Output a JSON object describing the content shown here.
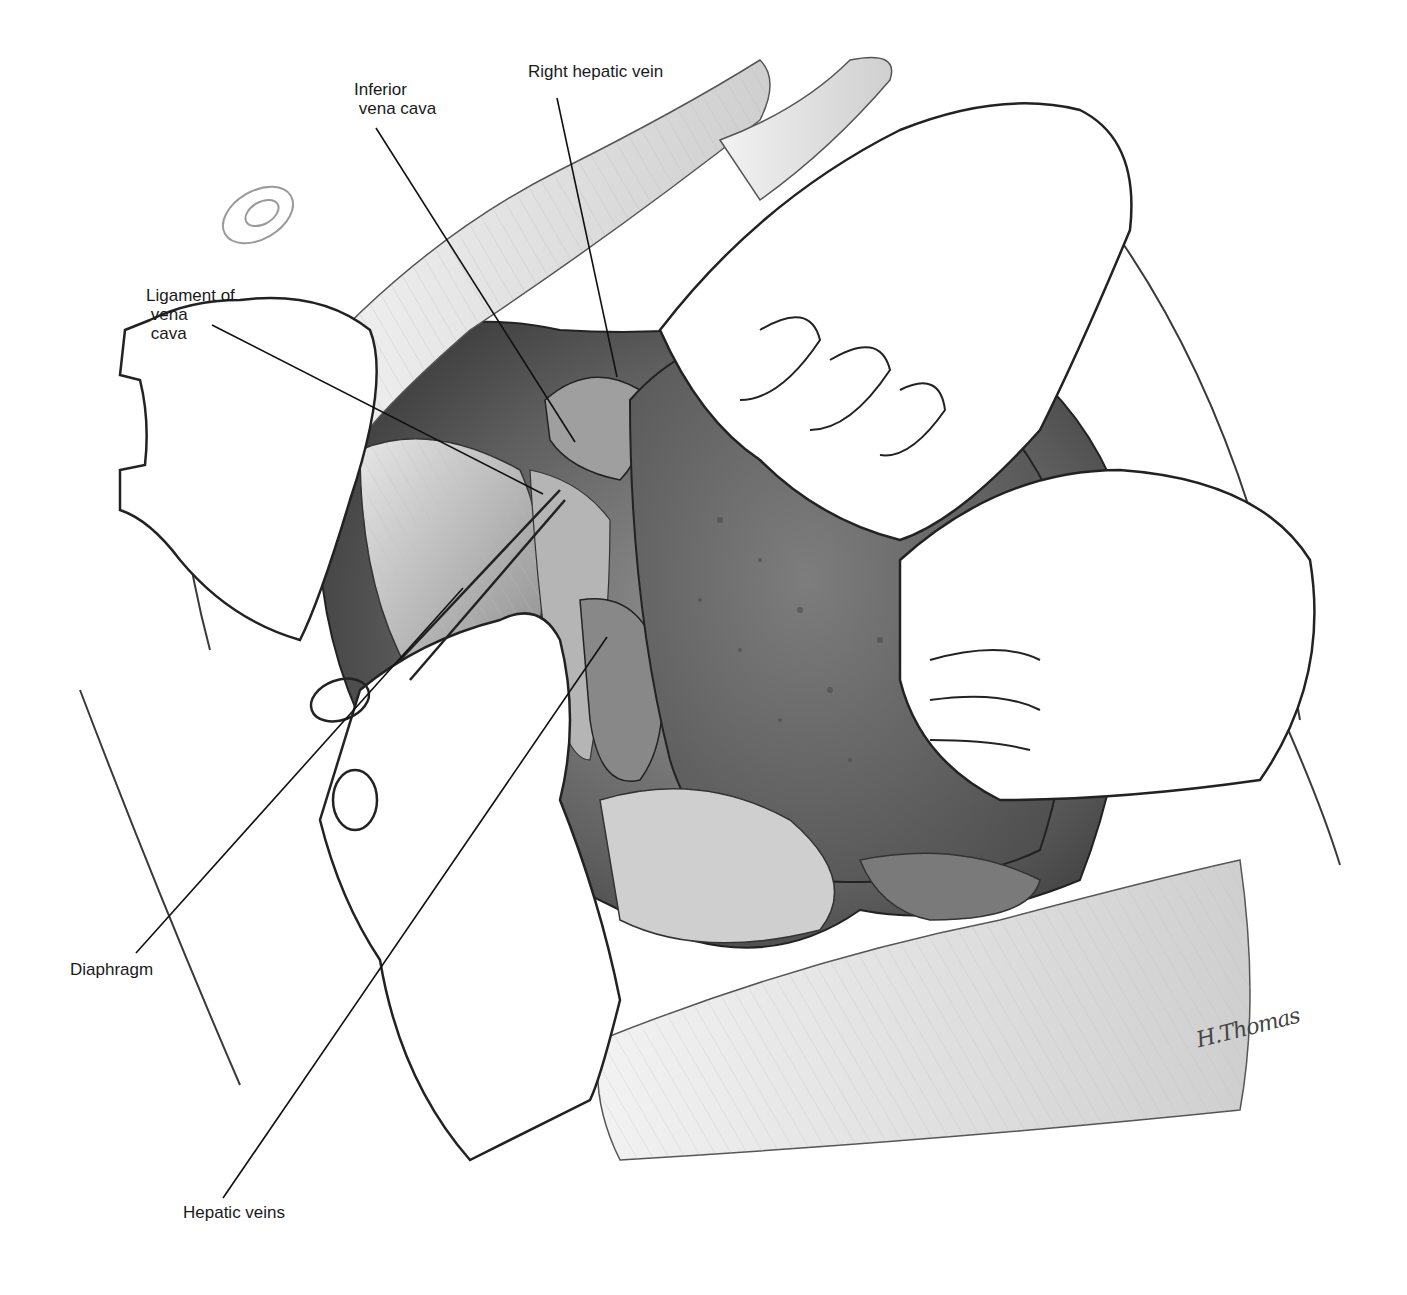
{
  "figure": {
    "labels": {
      "inferior_vena_cava": "Inferior\n vena cava",
      "right_hepatic_vein": "Right hepatic vein",
      "ligament_of_vena_cava": "Ligament of\n vena\n cava",
      "diaphragm": "Diaphragm",
      "hepatic_veins": "Hepatic veins"
    },
    "signature": "H.Thomas",
    "colors": {
      "background": "#ffffff",
      "line": "#1a1a1a",
      "liver": "#6e6e6e",
      "cavity_dark": "#5a5a5a",
      "glove": "#ffffff",
      "tissue": "#d9d9d9"
    }
  }
}
